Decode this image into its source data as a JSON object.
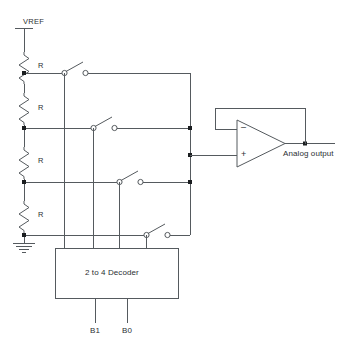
{
  "diagram": {
    "supply_label": "VREF",
    "resistor_labels": [
      "R",
      "R",
      "R",
      "R"
    ],
    "decoder_label": "2 to 4 Decoder",
    "input_labels": [
      "B1",
      "B0"
    ],
    "output_label": "Analog output",
    "opamp": {
      "inverting_sign": "–",
      "noninverting_sign": "+"
    },
    "colors": {
      "wire": "#555a5e",
      "node": "#1b1e20",
      "text": "#2b2f33",
      "background": "#ffffff"
    }
  }
}
